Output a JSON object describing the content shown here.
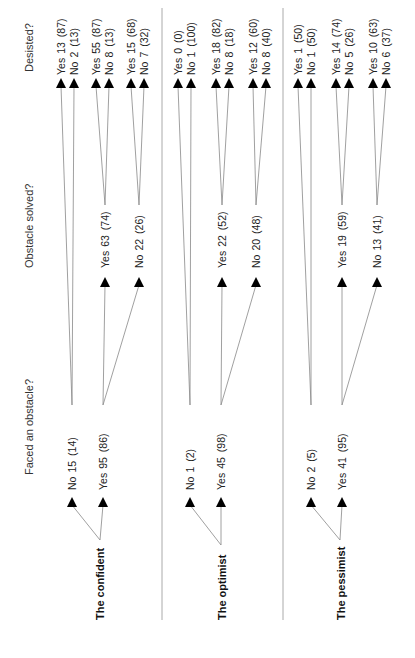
{
  "headers": {
    "level1": "Faced an obstacle?",
    "level2": "Obstacle solved?",
    "level3": "Desisted?"
  },
  "groups": [
    {
      "name": "The confident",
      "faced": [
        {
          "label": "No",
          "n": "15",
          "pct": "(14)"
        },
        {
          "label": "Yes",
          "n": "95",
          "pct": "(86)"
        }
      ],
      "solved": [
        {
          "label": "Yes",
          "n": "63",
          "pct": "(74)"
        },
        {
          "label": "No",
          "n": "22",
          "pct": "(26)"
        }
      ],
      "desisted": [
        {
          "label": "Yes",
          "n": "13",
          "pct": "(87)"
        },
        {
          "label": "No",
          "n": "2",
          "pct": "(13)"
        },
        {
          "label": "Yes",
          "n": "55",
          "pct": "(87)"
        },
        {
          "label": "No",
          "n": "8",
          "pct": "(13)"
        },
        {
          "label": "Yes",
          "n": "15",
          "pct": "(68)"
        },
        {
          "label": "No",
          "n": "7",
          "pct": "(32)"
        }
      ]
    },
    {
      "name": "The optimist",
      "faced": [
        {
          "label": "No",
          "n": "1",
          "pct": "(2)"
        },
        {
          "label": "Yes",
          "n": "45",
          "pct": "(98)"
        }
      ],
      "solved": [
        {
          "label": "Yes",
          "n": "22",
          "pct": "(52)"
        },
        {
          "label": "No",
          "n": "20",
          "pct": "(48)"
        }
      ],
      "desisted": [
        {
          "label": "Yes",
          "n": "0",
          "pct": "(0)"
        },
        {
          "label": "No",
          "n": "1",
          "pct": "(100)"
        },
        {
          "label": "Yes",
          "n": "18",
          "pct": "(82)"
        },
        {
          "label": "No",
          "n": "8",
          "pct": "(18)"
        },
        {
          "label": "Yes",
          "n": "12",
          "pct": "(60)"
        },
        {
          "label": "No",
          "n": "8",
          "pct": "(40)"
        }
      ]
    },
    {
      "name": "The pessimist",
      "faced": [
        {
          "label": "No",
          "n": "2",
          "pct": "(5)"
        },
        {
          "label": "Yes",
          "n": "41",
          "pct": "(95)"
        }
      ],
      "solved": [
        {
          "label": "Yes",
          "n": "19",
          "pct": "(59)"
        },
        {
          "label": "No",
          "n": "13",
          "pct": "(41)"
        }
      ],
      "desisted": [
        {
          "label": "Yes",
          "n": "1",
          "pct": "(50)"
        },
        {
          "label": "No",
          "n": "1",
          "pct": "(50)"
        },
        {
          "label": "Yes",
          "n": "14",
          "pct": "(74)"
        },
        {
          "label": "No",
          "n": "5",
          "pct": "(26)"
        },
        {
          "label": "Yes",
          "n": "10",
          "pct": "(63)"
        },
        {
          "label": "No",
          "n": "6",
          "pct": "(37)"
        }
      ]
    }
  ]
}
